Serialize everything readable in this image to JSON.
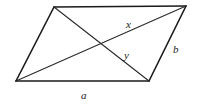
{
  "diagram": {
    "vertices": {
      "top_left": [
        54,
        7
      ],
      "top_right": [
        186,
        6
      ],
      "bottom_right": [
        149,
        81
      ],
      "bottom_left": [
        16,
        81
      ]
    },
    "sides": [
      {
        "from": "top_left",
        "to": "top_right"
      },
      {
        "from": "top_right",
        "to": "bottom_right",
        "label": "b"
      },
      {
        "from": "bottom_right",
        "to": "bottom_left",
        "label": "a"
      },
      {
        "from": "bottom_left",
        "to": "top_left"
      }
    ],
    "diagonals": [
      {
        "from": "bottom_left",
        "to": "top_right",
        "label": "x"
      },
      {
        "from": "top_left",
        "to": "bottom_right",
        "label": "y"
      }
    ],
    "labels": {
      "x": {
        "text": "x",
        "pos": [
          126,
          28
        ]
      },
      "y": {
        "text": "y",
        "pos": [
          124,
          59
        ]
      },
      "b": {
        "text": "b",
        "pos": [
          173,
          53
        ]
      },
      "a": {
        "text": "a",
        "pos": [
          81,
          99
        ]
      }
    },
    "colors": {
      "stroke": "#1a1a1a",
      "background": "#ffffff"
    }
  }
}
